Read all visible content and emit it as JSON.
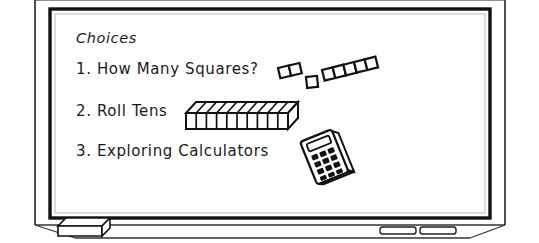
{
  "scene": {
    "title": "classroom-whiteboard-choices-list",
    "board_heading": "Choices",
    "ink_color": "#1a1a1a",
    "board_color": "#ffffff",
    "frame_color": "#111111",
    "ledge_color": "#333333"
  },
  "board": {
    "heading": "Choices",
    "items": [
      {
        "number": "1.",
        "label": "1. How Many Squares?",
        "illustration": "base-ten-unit-blocks"
      },
      {
        "number": "2.",
        "label": "2. Roll Tens",
        "illustration": "base-ten-rod"
      },
      {
        "number": "3.",
        "label": "3. Exploring Calculators",
        "illustration": "calculator"
      }
    ]
  },
  "illustrations": {
    "domino_pair_units": 2,
    "single_square_units": 1,
    "strip_units": 5,
    "rod_units": 10,
    "calculator_button_rows": 4,
    "calculator_button_cols": 3
  },
  "ledge": {
    "eraser_label": "eraser",
    "marker_count": 2
  }
}
